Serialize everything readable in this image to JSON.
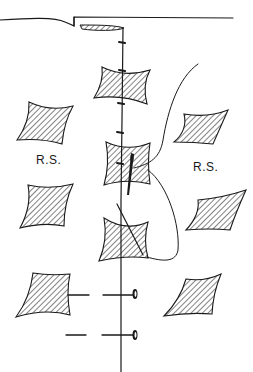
{
  "illustration": {
    "subject": "hand-drawn sewing diagram: fabric squares stitched along a center seam line with needle, thread, and pins",
    "labels": {
      "left": "R.S.",
      "right": "R.S."
    },
    "colors": {
      "ink": "#1a1a1a",
      "background": "#ffffff"
    }
  }
}
